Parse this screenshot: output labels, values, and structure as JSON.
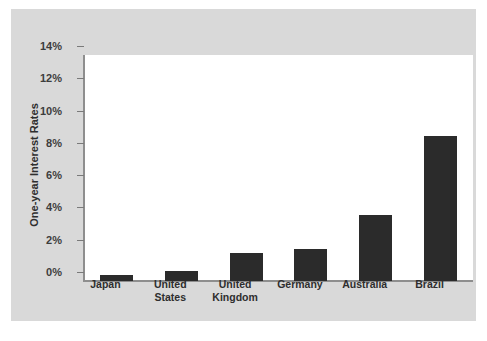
{
  "chart_data": {
    "type": "bar",
    "title": "",
    "subtitle": "",
    "xlabel": "",
    "ylabel": "One-year Interest Rates",
    "categories": [
      "Japan",
      "United States",
      "United Kingdom",
      "Germany",
      "Australia",
      "Brazil"
    ],
    "values": [
      0.4,
      0.65,
      1.75,
      2.0,
      4.1,
      9.0
    ],
    "value_unit": "%",
    "ylim": [
      0,
      14
    ],
    "ytick_values": [
      0,
      2,
      4,
      6,
      8,
      10,
      12,
      14
    ],
    "ytick_labels": [
      "0%",
      "2%",
      "4%",
      "6%",
      "8%",
      "10%",
      "12%",
      "14%"
    ],
    "grid": false,
    "legend": null,
    "legend_position": "none",
    "bar_color": "#2b2b2b",
    "plot_background": "#ffffff",
    "figure_background": "#d9d9d9",
    "axis_color": "#8e8e8e",
    "text_color": "#2e2e2e",
    "annotations": []
  },
  "axis": {
    "y_title": "One-year Interest Rates",
    "ticks": [
      {
        "label": "14%",
        "value": 14
      },
      {
        "label": "12%",
        "value": 12
      },
      {
        "label": "10%",
        "value": 10
      },
      {
        "label": "8%",
        "value": 8
      },
      {
        "label": "6%",
        "value": 6
      },
      {
        "label": "4%",
        "value": 4
      },
      {
        "label": "2%",
        "value": 2
      },
      {
        "label": "0%",
        "value": 0
      }
    ]
  },
  "categories": [
    {
      "label_line1": "Japan",
      "label_line2": ""
    },
    {
      "label_line1": "United",
      "label_line2": "States"
    },
    {
      "label_line1": "United",
      "label_line2": "Kingdom"
    },
    {
      "label_line1": "Germany",
      "label_line2": ""
    },
    {
      "label_line1": "Australia",
      "label_line2": ""
    },
    {
      "label_line1": "Brazil",
      "label_line2": ""
    }
  ]
}
